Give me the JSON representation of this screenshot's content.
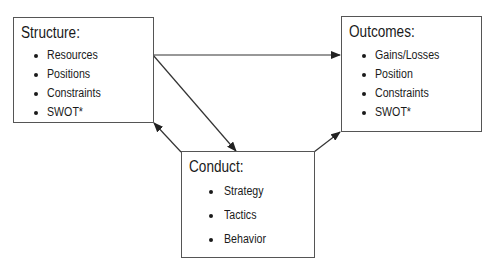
{
  "diagram": {
    "structure": {
      "title": "Structure:",
      "items": [
        "Resources",
        "Positions",
        "Constraints",
        "SWOT*"
      ]
    },
    "outcomes": {
      "title": "Outcomes:",
      "items": [
        "Gains/Losses",
        "Position",
        "Constraints",
        "SWOT*"
      ]
    },
    "conduct": {
      "title": "Conduct:",
      "items": [
        "Strategy",
        "Tactics",
        "Behavior"
      ]
    },
    "edges": [
      {
        "from": "structure",
        "to": "outcomes"
      },
      {
        "from": "structure",
        "to": "conduct"
      },
      {
        "from": "conduct",
        "to": "structure"
      },
      {
        "from": "conduct",
        "to": "outcomes"
      }
    ],
    "colors": {
      "line": "#333333",
      "border": "#555555",
      "text": "#1a1a1a"
    }
  }
}
